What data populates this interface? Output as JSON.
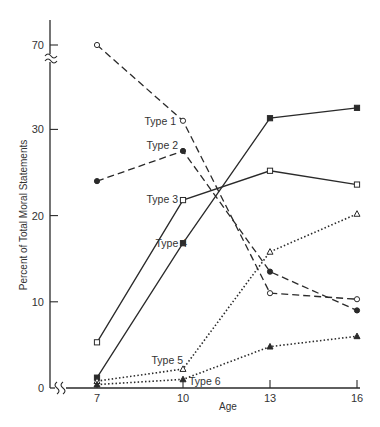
{
  "chart_data": {
    "type": "line",
    "title": "",
    "xlabel": "Age",
    "ylabel": "Percent of Total Moral Statements",
    "x": [
      7,
      10,
      13,
      16
    ],
    "x_tick_labels": [
      "7",
      "10",
      "13",
      "16"
    ],
    "y_tick_labels": [
      "0",
      "10",
      "20",
      "30",
      "70"
    ],
    "y_ticks": [
      0,
      10,
      20,
      30,
      70
    ],
    "ylim": [
      0,
      72
    ],
    "y_axis_break": [
      33,
      68
    ],
    "x_axis_break": true,
    "grid": false,
    "legend": "inline labels",
    "series": [
      {
        "name": "Type 1",
        "values": [
          70,
          31,
          11,
          10.3
        ],
        "line": "dashed",
        "marker": "open-circle",
        "label_at": 1
      },
      {
        "name": "Type 2",
        "values": [
          24,
          27.5,
          13.5,
          9
        ],
        "line": "dashed",
        "marker": "filled-circle",
        "label_at": 1
      },
      {
        "name": "Type 3",
        "values": [
          5.3,
          21.8,
          25.2,
          23.6
        ],
        "line": "solid",
        "marker": "open-square",
        "label_at": 1
      },
      {
        "name": "Type 4",
        "values": [
          1.2,
          16.8,
          31.3,
          32.5
        ],
        "line": "solid",
        "marker": "filled-square",
        "label_at": 1
      },
      {
        "name": "Type 5",
        "values": [
          0.8,
          2.2,
          15.8,
          20.2
        ],
        "line": "dotted",
        "marker": "open-triangle",
        "label_at": 1
      },
      {
        "name": "Type 6",
        "values": [
          0.4,
          1.0,
          4.8,
          6.0
        ],
        "line": "dotted",
        "marker": "filled-triangle",
        "label_at": 1
      }
    ],
    "colors": {
      "ink": "#2a2a2a",
      "background": "#ffffff"
    }
  }
}
